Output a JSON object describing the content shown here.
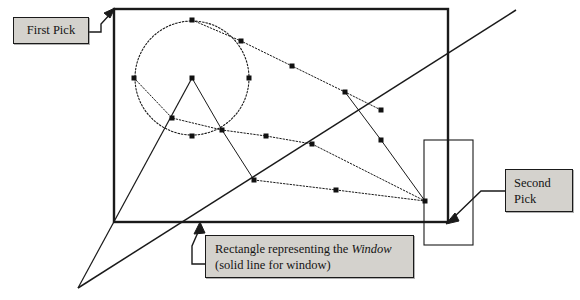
{
  "figure": {
    "background_color": "#ffffff",
    "stroke_color": "#1a1a1a",
    "callout_fill": "#d4d2cd",
    "callout_border": "#1a1a1a"
  },
  "callouts": {
    "first_pick": {
      "label": "First Pick",
      "box": {
        "x": 13,
        "y": 17,
        "w": 76,
        "h": 27
      },
      "leader": "elbow-arrow-up-right",
      "points_to": {
        "x": 114,
        "y": 9
      }
    },
    "second_pick": {
      "line1": "Second",
      "line2": "Pick",
      "box": {
        "x": 505,
        "y": 169,
        "w": 68,
        "h": 43
      },
      "leader": "elbow-arrow-down-left",
      "points_to": {
        "x": 448,
        "y": 222
      }
    },
    "window_note": {
      "line1_a": "Rectangle representing the ",
      "line1_em": "Window",
      "line2": "(solid line for window)",
      "box": {
        "x": 205,
        "y": 235,
        "w": 209,
        "h": 43
      },
      "leader": "elbow-arrow-up",
      "points_to": {
        "x": 199,
        "y": 223
      }
    }
  },
  "shapes": {
    "window_rect": {
      "name": "Window",
      "style": "solid",
      "stroke_width": 2.4,
      "x": 114,
      "y": 9,
      "w": 334,
      "h": 213
    },
    "secondary_rect": {
      "name": "secondary rectangle",
      "style": "solid",
      "stroke_width": 1.1,
      "x": 424,
      "y": 140,
      "w": 49,
      "h": 105
    },
    "circle": {
      "name": "entity circle",
      "style": "dotted",
      "cx": 192,
      "cy": 78,
      "r": 57
    },
    "crossing_line": {
      "name": "long diagonal",
      "style": "solid",
      "x1": 78,
      "y1": 288,
      "x2": 516,
      "y2": 10
    },
    "apex_line": {
      "name": "apex leg",
      "style": "solid",
      "x1": 78,
      "y1": 288,
      "x2": 192,
      "y2": 78
    },
    "dotted_polyline_1": {
      "name": "upper chain",
      "points": [
        [
          192,
          20
        ],
        [
          241,
          41
        ],
        [
          292,
          66
        ],
        [
          345,
          92
        ],
        [
          381,
          110
        ]
      ]
    },
    "dotted_polyline_2": {
      "name": "middle chain",
      "points": [
        [
          134,
          78
        ],
        [
          172,
          118
        ],
        [
          222,
          130
        ],
        [
          266,
          136
        ],
        [
          312,
          144
        ]
      ]
    },
    "dotted_polyline_3": {
      "name": "lower chain",
      "points": [
        [
          254,
          180
        ],
        [
          336,
          190
        ],
        [
          425,
          201
        ]
      ]
    },
    "connector_segments": [
      {
        "name": "center-to-right-node",
        "x1": 192,
        "y1": 78,
        "x2": 222,
        "y2": 130
      },
      {
        "name": "node-to-lower-vertex",
        "x1": 222,
        "y1": 130,
        "x2": 254,
        "y2": 180
      },
      {
        "name": "upper-to-lower-right",
        "x1": 345,
        "y1": 92,
        "x2": 381,
        "y2": 140
      },
      {
        "name": "right-descend",
        "x1": 381,
        "y1": 140,
        "x2": 425,
        "y2": 201
      },
      {
        "name": "chain3-to-right-edge",
        "x1": 312,
        "y1": 144,
        "x2": 425,
        "y2": 201
      }
    ],
    "node_markers": [
      [
        192,
        20
      ],
      [
        241,
        41
      ],
      [
        292,
        66
      ],
      [
        345,
        92
      ],
      [
        381,
        110
      ],
      [
        134,
        78
      ],
      [
        249,
        78
      ],
      [
        192,
        78
      ],
      [
        192,
        136
      ],
      [
        172,
        118
      ],
      [
        222,
        130
      ],
      [
        266,
        136
      ],
      [
        312,
        144
      ],
      [
        254,
        180
      ],
      [
        336,
        190
      ],
      [
        425,
        201
      ],
      [
        381,
        140
      ]
    ],
    "node_marker_size": 5
  }
}
